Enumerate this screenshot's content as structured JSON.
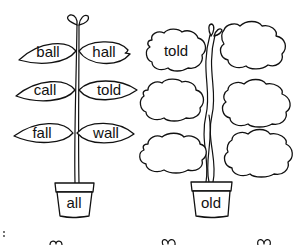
{
  "plants": [
    {
      "name": "all-plant",
      "pot_label": "all",
      "leaves": [
        {
          "side": "left",
          "row": 1,
          "word": "ball"
        },
        {
          "side": "right",
          "row": 1,
          "word": "hall"
        },
        {
          "side": "left",
          "row": 2,
          "word": "call"
        },
        {
          "side": "right",
          "row": 2,
          "word": "told"
        },
        {
          "side": "left",
          "row": 3,
          "word": "fall"
        },
        {
          "side": "right",
          "row": 3,
          "word": "wall"
        }
      ]
    },
    {
      "name": "old-plant",
      "pot_label": "old",
      "leaves": [
        {
          "side": "left",
          "row": 1,
          "word": "told"
        },
        {
          "side": "right",
          "row": 1,
          "word": ""
        },
        {
          "side": "left",
          "row": 2,
          "word": ""
        },
        {
          "side": "right",
          "row": 2,
          "word": ""
        },
        {
          "side": "left",
          "row": 3,
          "word": ""
        },
        {
          "side": "right",
          "row": 3,
          "word": ""
        }
      ]
    }
  ]
}
